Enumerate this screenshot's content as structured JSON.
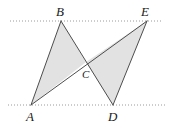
{
  "figure": {
    "canvas": {
      "width": 170,
      "height": 127,
      "background": "#ffffff"
    },
    "style": {
      "stroke_color": "#4d4d4d",
      "stroke_width": 1,
      "fill_color": "#e2e2e2",
      "fill_opacity": 1,
      "guide_color": "#9a9a9a",
      "guide_dash": "1,2",
      "label_color": "#1a1a1a"
    },
    "points": [
      {
        "name": "A",
        "label": "A",
        "x": 31,
        "y": 105,
        "label_x": 26,
        "label_y": 121
      },
      {
        "name": "B",
        "label": "B",
        "x": 61,
        "y": 21,
        "label_x": 56,
        "label_y": 16
      },
      {
        "name": "C",
        "label": "C",
        "x": 86,
        "y": 62,
        "label_x": 82,
        "label_y": 78
      },
      {
        "name": "D",
        "label": "D",
        "x": 113,
        "y": 105,
        "label_x": 108,
        "label_y": 121
      },
      {
        "name": "E",
        "label": "E",
        "x": 147,
        "y": 21,
        "label_x": 141,
        "label_y": 16
      }
    ],
    "triangles": [
      {
        "name": "triangle-abc",
        "vertices": "A,B,C",
        "points": "31,105 61,21 86,62"
      },
      {
        "name": "triangle-cde",
        "vertices": "C,D,E",
        "points": "86,62 113,105 147,21"
      }
    ],
    "segments": [
      {
        "name": "segment-ae",
        "from": "A",
        "to": "E",
        "x1": 31,
        "y1": 105,
        "x2": 147,
        "y2": 21
      },
      {
        "name": "segment-bd",
        "from": "B",
        "to": "D",
        "x1": 61,
        "y1": 21,
        "x2": 113,
        "y2": 105
      },
      {
        "name": "segment-ab",
        "from": "A",
        "to": "B",
        "x1": 31,
        "y1": 105,
        "x2": 61,
        "y2": 21
      },
      {
        "name": "segment-de",
        "from": "D",
        "to": "E",
        "x1": 113,
        "y1": 105,
        "x2": 147,
        "y2": 21
      }
    ],
    "guide_lines": [
      {
        "name": "top-dotted-line",
        "x1": 10,
        "y1": 21,
        "x2": 163,
        "y2": 21
      },
      {
        "name": "bottom-dotted-line",
        "x1": 8,
        "y1": 105,
        "x2": 165,
        "y2": 105
      }
    ]
  }
}
